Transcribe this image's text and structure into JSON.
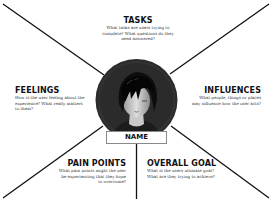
{
  "diagram": {
    "type": "empathy-map",
    "center": {
      "label": "NAME",
      "avatar": "persona-avatar-icon"
    },
    "sections": {
      "tasks": {
        "title": "TASKS",
        "description": "What tasks are users trying to complete? What questions do they need answered?"
      },
      "feelings": {
        "title": "FEELINGS",
        "description": "How is the user feeling about the experience? What really matters to them?"
      },
      "influences": {
        "title": "INFLUENCES",
        "description": "What people, things or places may influence how the user acts?"
      },
      "pain_points": {
        "title": "PAIN POINTS",
        "description": "What pain points might the user be experiencing that they hope to overcome?"
      },
      "overall_goal": {
        "title": "OVERALL GOAL",
        "description": "What is the users ultimate goal? What are they trying to achieve?"
      }
    },
    "colors": {
      "lines": "#111111",
      "circle": "#2b2b2b",
      "background": "#ffffff",
      "name_box_border": "#8a8a8a"
    }
  }
}
